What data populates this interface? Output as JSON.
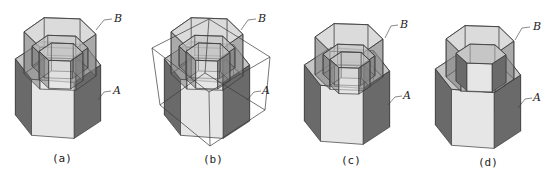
{
  "figures": [
    {
      "id": "a",
      "caption": "(a)",
      "caption_pos": [
        52,
        152
      ],
      "label_B": "B",
      "label_B_pos": [
        114,
        12
      ],
      "label_A": "A",
      "label_A_pos": [
        113,
        84
      ],
      "leader_B": [
        [
          96,
          30
        ],
        [
          104,
          20
        ],
        [
          112,
          19
        ]
      ],
      "leader_A": [
        [
          98,
          100
        ],
        [
          104,
          92
        ],
        [
          111,
          91
        ]
      ],
      "prisms": [
        {
          "role": "A-lower-outer",
          "cx": 58,
          "cy": 62,
          "rx": 43,
          "ry": 22,
          "h": 56,
          "rot": 8,
          "solid": true
        },
        {
          "role": "B-upper-outer",
          "cx": 60,
          "cy": 33,
          "rx": 36,
          "ry": 17,
          "h": 42,
          "rot": 4,
          "solid": false
        },
        {
          "role": "inner-ring-1",
          "cx": 60,
          "cy": 47,
          "rx": 28,
          "ry": 13,
          "h": 20,
          "rot": 4,
          "solid": false
        },
        {
          "role": "inner-ring-2",
          "cx": 61,
          "cy": 52,
          "rx": 22,
          "ry": 10,
          "h": 28,
          "rot": 4,
          "solid": false
        }
      ]
    },
    {
      "id": "b",
      "caption": "(b)",
      "caption_pos": [
        203,
        153
      ],
      "label_B": "B",
      "label_B_pos": [
        258,
        12
      ],
      "label_A": "A",
      "label_A_pos": [
        262,
        84
      ],
      "leader_B": [
        [
          241,
          30
        ],
        [
          248,
          20
        ],
        [
          256,
          19
        ]
      ],
      "leader_A": [
        [
          247,
          100
        ],
        [
          254,
          92
        ],
        [
          261,
          91
        ]
      ],
      "cube": {
        "top": [
          [
            152,
            48
          ],
          [
            209,
            19
          ],
          [
            270,
            57
          ],
          [
            209,
            92
          ]
        ],
        "bottom": [
          [
            160,
            105
          ],
          [
            205,
            73
          ],
          [
            265,
            110
          ],
          [
            210,
            146
          ]
        ]
      },
      "prisms": [
        {
          "role": "A-lower-outer",
          "cx": 207,
          "cy": 62,
          "rx": 43,
          "ry": 22,
          "h": 56,
          "rot": 8,
          "solid": true
        },
        {
          "role": "B-upper-outer",
          "cx": 207,
          "cy": 33,
          "rx": 36,
          "ry": 17,
          "h": 42,
          "rot": 4,
          "solid": false
        },
        {
          "role": "inner-ring-1",
          "cx": 207,
          "cy": 47,
          "rx": 28,
          "ry": 13,
          "h": 20,
          "rot": 4,
          "solid": false
        },
        {
          "role": "inner-ring-2",
          "cx": 208,
          "cy": 52,
          "rx": 22,
          "ry": 10,
          "h": 28,
          "rot": 4,
          "solid": false
        }
      ]
    },
    {
      "id": "c",
      "caption": "(c)",
      "caption_pos": [
        341,
        154
      ],
      "label_B": "B",
      "label_B_pos": [
        400,
        18
      ],
      "label_A": "A",
      "label_A_pos": [
        403,
        89
      ],
      "leader_B": [
        [
          385,
          38
        ],
        [
          391,
          26
        ],
        [
          398,
          25
        ]
      ],
      "leader_A": [
        [
          388,
          105
        ],
        [
          395,
          97
        ],
        [
          402,
          96
        ]
      ],
      "prisms": [
        {
          "role": "A-lower-outer",
          "cx": 347,
          "cy": 68,
          "rx": 43,
          "ry": 22,
          "h": 56,
          "rot": 8,
          "solid": true
        },
        {
          "role": "B-upper-outer",
          "cx": 349,
          "cy": 38,
          "rx": 34,
          "ry": 16,
          "h": 38,
          "rot": 4,
          "solid": false
        },
        {
          "role": "inner-ring-1",
          "cx": 349,
          "cy": 55,
          "rx": 26,
          "ry": 12,
          "h": 20,
          "rot": 4,
          "solid": false
        },
        {
          "role": "inner-ring-2",
          "cx": 350,
          "cy": 60,
          "rx": 20,
          "ry": 9,
          "h": 26,
          "rot": 4,
          "solid": false
        }
      ]
    },
    {
      "id": "d",
      "caption": "(d)",
      "caption_pos": [
        478,
        156
      ],
      "label_B": "B",
      "label_B_pos": [
        533,
        20
      ],
      "label_A": "A",
      "label_A_pos": [
        533,
        91
      ],
      "leader_B": [
        [
          515,
          40
        ],
        [
          522,
          28
        ],
        [
          530,
          27
        ]
      ],
      "leader_A": [
        [
          518,
          108
        ],
        [
          525,
          99
        ],
        [
          532,
          98
        ]
      ],
      "prisms": [
        {
          "role": "A-lower-outer",
          "cx": 478,
          "cy": 72,
          "rx": 43,
          "ry": 22,
          "h": 56,
          "rot": 8,
          "solid": true
        },
        {
          "role": "B-upper-outer",
          "cx": 480,
          "cy": 40,
          "rx": 34,
          "ry": 16,
          "h": 38,
          "rot": 4,
          "solid": false
        },
        {
          "role": "inner-ring-1",
          "cx": 481,
          "cy": 54,
          "rx": 25,
          "ry": 11,
          "h": 28,
          "rot": 4,
          "solid": true
        }
      ]
    }
  ],
  "colors": {
    "line": "#3a3a3a",
    "face_light": "#e6e6e6",
    "face_mid": "#b8b8b8",
    "face_dark": "#6a6a6a",
    "face_top": "#d4d4d4"
  }
}
